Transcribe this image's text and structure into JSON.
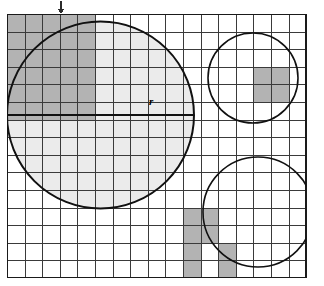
{
  "figure": {
    "label_r": "r",
    "colors": {
      "background": "#ffffff",
      "grid_line": "#3a3a3a",
      "grid_border": "#1a1a1a",
      "circle_stroke": "#111111",
      "light_fill": "#ebebeb",
      "dark_fill": "#b3b3b3",
      "radius_line": "#111111",
      "arrow": "#2b2b2b"
    },
    "grid": {
      "origin_x": 7,
      "origin_y": 14,
      "cell": 17.6,
      "cols": 17,
      "rows": 15,
      "line_width": 1
    },
    "arrow": {
      "name": "down-arrow-marker",
      "x": 61,
      "y_top": 1,
      "y_tip": 14
    },
    "radius_segment": {
      "x1": 7,
      "x2": 194,
      "y": 115,
      "thickness": 2.6
    },
    "r_label_pos": {
      "left": 149,
      "top": 96
    },
    "circles": [
      {
        "name": "large-circle",
        "cx": 100.5,
        "cy": 115,
        "r": 93.5,
        "fill": "#ebebeb",
        "stroke_width": 2
      },
      {
        "name": "top-right-circle",
        "cx": 253,
        "cy": 78,
        "r": 45,
        "fill": "none",
        "stroke_width": 1.6
      },
      {
        "name": "bottom-right-circle",
        "cx": 258,
        "cy": 212,
        "r": 55,
        "fill": "none",
        "stroke_width": 1.6
      }
    ],
    "shaded_blocks": [
      {
        "name": "shaded-block-large-circle",
        "col": 0,
        "row": 0,
        "cols": 5,
        "rows": 6
      },
      {
        "name": "shaded-block-top-right-circle",
        "col": 14,
        "row": 3,
        "cols": 2,
        "rows": 2
      },
      {
        "name": "shaded-block-bottom-right-circle",
        "col": 10,
        "row": 11,
        "cols": 2,
        "rows": 2
      },
      {
        "name": "shaded-block-bottom-right-circle-lower",
        "col": 10,
        "row": 13,
        "cols": 1,
        "rows": 2
      },
      {
        "name": "shaded-block-bottom-right-circle-right",
        "col": 12,
        "row": 13,
        "cols": 1,
        "rows": 2
      }
    ],
    "counts": {
      "grid_columns": 17,
      "grid_rows": 15,
      "circle_count": 3
    }
  }
}
